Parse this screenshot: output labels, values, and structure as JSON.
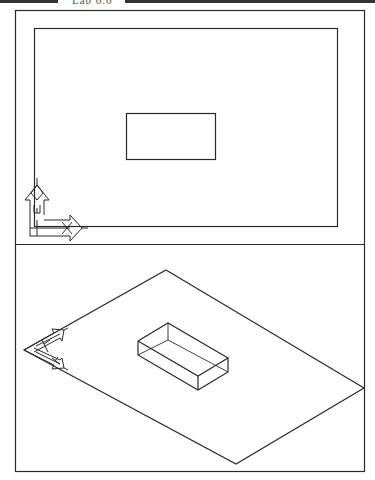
{
  "header": {
    "label": "Lab 6.6"
  },
  "viewports": {
    "top": {
      "name": "plan-view",
      "limits_rect": [
        34,
        28,
        337,
        226
      ],
      "object_rect": [
        126,
        113,
        215,
        159
      ],
      "ucs_icon": "ucs-icon-2d"
    },
    "bottom": {
      "name": "isometric-view",
      "plane": [
        [
          166,
          270
        ],
        [
          364,
          388
        ],
        [
          236,
          464
        ],
        [
          24,
          350
        ]
      ],
      "ucs_icon": "ucs-icon-isometric"
    }
  },
  "colors": {
    "line": "#2a2a2a",
    "background": "#ffffff"
  }
}
